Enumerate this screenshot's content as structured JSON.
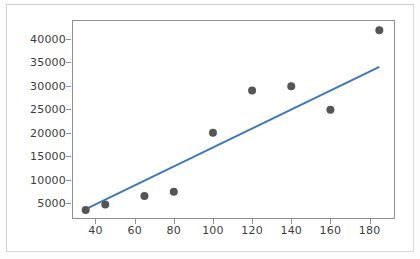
{
  "chart_data": {
    "type": "scatter",
    "title": "",
    "xlabel": "",
    "ylabel": "",
    "xlim": [
      28,
      193
    ],
    "ylim": [
      1600,
      44000
    ],
    "grid": false,
    "legend": "none",
    "xticks": [
      40,
      60,
      80,
      100,
      120,
      140,
      160,
      180
    ],
    "xtick_labels": [
      "40",
      "60",
      "80",
      "100",
      "120",
      "140",
      "160",
      "180"
    ],
    "yticks": [
      5000,
      10000,
      15000,
      20000,
      25000,
      30000,
      35000,
      40000
    ],
    "ytick_labels": [
      "5000",
      "10000",
      "15000",
      "20000",
      "25000",
      "30000",
      "35000",
      "40000"
    ],
    "series": [
      {
        "name": "observations",
        "type": "scatter",
        "marker": "circle",
        "color": "#555555",
        "x": [
          35,
          45,
          65,
          80,
          100,
          120,
          140,
          160,
          185
        ],
        "y": [
          3500,
          4700,
          6500,
          7400,
          20000,
          29000,
          29900,
          24900,
          41800
        ],
        "points": [
          {
            "x": 35,
            "y": 3500
          },
          {
            "x": 45,
            "y": 4700
          },
          {
            "x": 65,
            "y": 6500
          },
          {
            "x": 80,
            "y": 7400
          },
          {
            "x": 100,
            "y": 20000
          },
          {
            "x": 120,
            "y": 29000
          },
          {
            "x": 140,
            "y": 29900
          },
          {
            "x": 160,
            "y": 24900
          },
          {
            "x": 185,
            "y": 41800
          }
        ]
      },
      {
        "name": "regression-line",
        "type": "line",
        "color": "#3f76c0",
        "x": [
          35,
          185
        ],
        "y": [
          3700,
          34000
        ]
      }
    ]
  },
  "figure": {
    "background": "#ffffff",
    "axes_edge_color": "#8f8f8f",
    "tick_label_color": "#3c3c3c",
    "marker_color": "#555555",
    "line_color": "#3f76c0"
  }
}
